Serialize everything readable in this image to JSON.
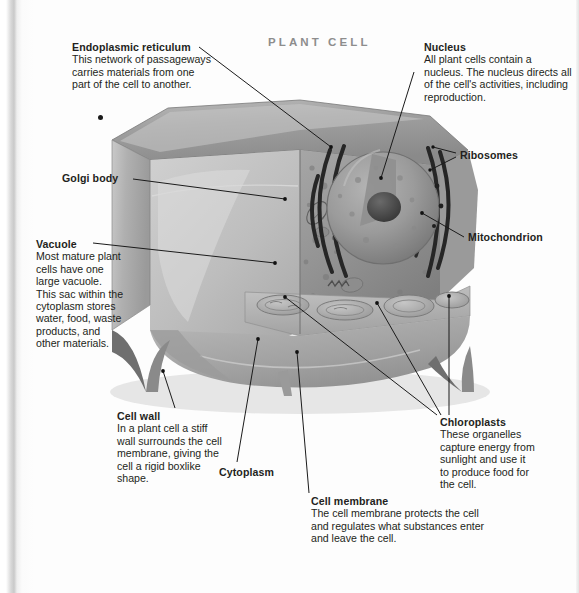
{
  "page": {
    "title": "PLANT CELL",
    "title_color": "#8d8d8d",
    "background": "#fdfdfd",
    "text_color": "#231f20"
  },
  "diagram": {
    "style": "grayscale textbook halftone scan"
  },
  "callouts": {
    "endoplasmic_reticulum": {
      "heading": "Endoplasmic reticulum",
      "body": "This network of passageways carries materials from one part of the cell to another."
    },
    "nucleus": {
      "heading": "Nucleus",
      "body": "All plant cells contain a nucleus. The nucleus directs all of the cell's activities, including reproduction."
    },
    "ribosomes": {
      "heading": "Ribosomes",
      "body": ""
    },
    "golgi_body": {
      "heading": "Golgi body",
      "body": ""
    },
    "mitochondrion": {
      "heading": "Mitochondrion",
      "body": ""
    },
    "vacuole": {
      "heading": "Vacuole",
      "body": "Most mature plant cells have one large vacuole. This sac within the cytoplasm stores water, food, waste products, and other materials."
    },
    "cell_wall": {
      "heading": "Cell wall",
      "body": "In a plant cell a stiff wall surrounds the cell membrane, giving the cell a rigid boxlike shape."
    },
    "cytoplasm": {
      "heading": "Cytoplasm",
      "body": ""
    },
    "cell_membrane": {
      "heading": "Cell membrane",
      "body": "The cell membrane protects the cell and regulates what substances enter and leave the cell."
    },
    "chloroplasts": {
      "heading": "Chloroplasts",
      "body": "These organelles capture energy from sunlight and use it to produce food for the cell."
    }
  }
}
